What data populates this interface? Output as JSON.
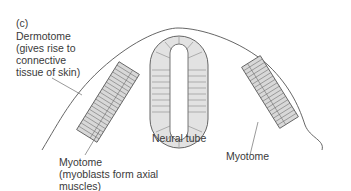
{
  "figure": {
    "panel_label": "(c)",
    "labels": {
      "dermotome": [
        "Dermotome",
        "(gives rise to",
        "connective",
        "tissue of skin)"
      ],
      "myotome_left": [
        "Myotome",
        "(myoblasts form axial",
        "muscles)"
      ],
      "neural_tube": "Neural tube",
      "myotome_right": "Myotome"
    },
    "colors": {
      "line": "#555555",
      "fill": "#d8d8d8",
      "text": "#3a3a3a"
    }
  }
}
